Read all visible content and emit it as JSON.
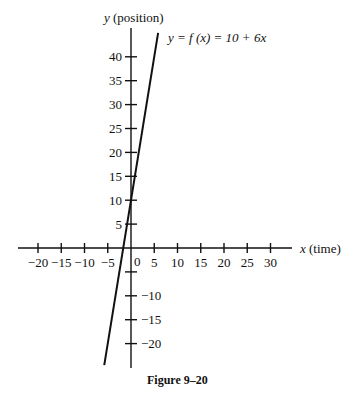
{
  "chart_data": {
    "type": "line",
    "xlabel": "x (time)",
    "ylabel": "y (position)",
    "caption": "Figure 9–20",
    "xlim": [
      -23,
      33
    ],
    "ylim": [
      -25,
      45
    ],
    "x_ticks": [
      -20,
      -15,
      -10,
      -5,
      0,
      5,
      10,
      15,
      20,
      25,
      30
    ],
    "x_tick_labels": [
      "−20",
      "−15",
      "−10",
      "−5",
      "0",
      "5",
      "10",
      "15",
      "20",
      "25",
      "30"
    ],
    "y_ticks": [
      40,
      35,
      30,
      25,
      20,
      15,
      10,
      5,
      -5,
      -10,
      -15,
      -20
    ],
    "y_tick_labels": [
      "40",
      "35",
      "30",
      "25",
      "20",
      "15",
      "10",
      "5",
      "",
      "−10",
      "−15",
      "−20"
    ],
    "grid": false,
    "series": [
      {
        "name": "y = 10 + 6x",
        "equation": "y = 10 + 6x",
        "x": [
          -5.75,
          5.83
        ],
        "y": [
          -24.5,
          45
        ]
      }
    ]
  },
  "labels": {
    "y_axis": "y",
    "y_axis_suffix": " (position)",
    "x_axis": "x",
    "x_axis_suffix": " (time)",
    "equation": "y = f (x) = 10 + 6x",
    "origin": "0",
    "caption": "Figure 9–20"
  }
}
